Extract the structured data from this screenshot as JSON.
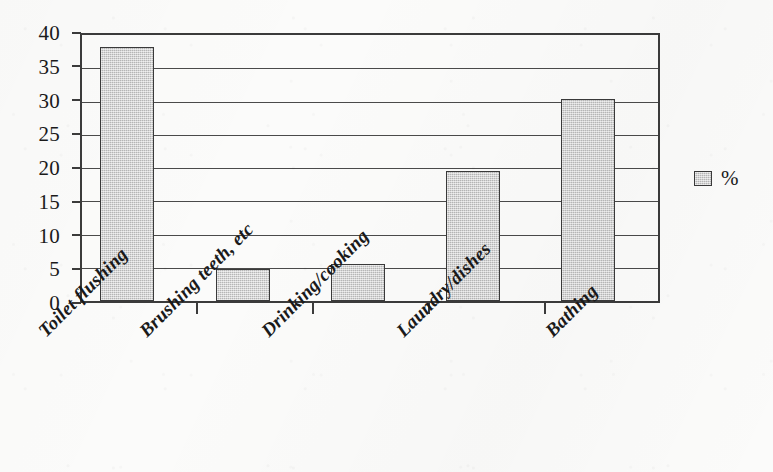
{
  "chart_data": {
    "type": "bar",
    "title": "",
    "subtitle": "",
    "xlabel": "",
    "ylabel": "",
    "categories": [
      "Toilet flushing",
      "Brushing teeth, etc",
      "Drinking/cooking",
      "Laundry/dishes",
      "Bathing"
    ],
    "values": [
      38.2,
      4.8,
      5.6,
      19.5,
      30.4
    ],
    "series": [
      {
        "name": "%",
        "values": [
          38.2,
          4.8,
          5.6,
          19.5,
          30.4
        ]
      }
    ],
    "ylim": [
      0,
      40
    ],
    "ytick_labels": [
      "40",
      "35",
      "30",
      "25",
      "20",
      "15",
      "10",
      "5",
      "0"
    ],
    "ytick_values": [
      40,
      35,
      30,
      25,
      20,
      15,
      10,
      5,
      0
    ],
    "grid": "horizontal",
    "legend_position": "right",
    "legend_entries": [
      "%"
    ],
    "bar_fill_color": "#c9c9c9",
    "bar_border_color": "#3a3a3a",
    "axis_color": "#3b3b3b",
    "background_color": "#fbfbfa"
  },
  "legend": {
    "label": "%"
  }
}
